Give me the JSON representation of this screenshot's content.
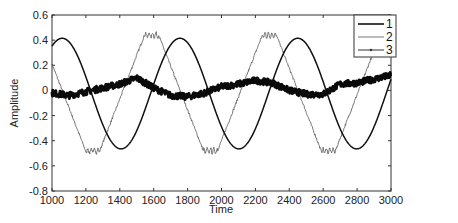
{
  "chart_data": {
    "type": "line",
    "title": "",
    "xlabel": "Time",
    "ylabel": "Amplitude",
    "xlim": [
      1000,
      3000
    ],
    "ylim": [
      -0.8,
      0.6
    ],
    "x_ticks": [
      "1000",
      "1200",
      "1400",
      "1600",
      "1800",
      "2000",
      "2200",
      "2400",
      "2600",
      "2800",
      "3000"
    ],
    "y_ticks": [
      "0.6",
      "0.4",
      "0.2",
      "0",
      "-0.2",
      "-0.4",
      "-0.6",
      "-0.8"
    ],
    "grid": false,
    "legend_position": "upper right",
    "x": [
      1000,
      1100,
      1200,
      1300,
      1400,
      1500,
      1600,
      1700,
      1800,
      1900,
      2000,
      2100,
      2200,
      2300,
      2400,
      2500,
      2600,
      2700,
      2800,
      2900,
      3000
    ],
    "series": [
      {
        "name": "1",
        "style": "thick dark smooth line",
        "values": [
          0.36,
          0.41,
          0.25,
          -0.05,
          -0.36,
          -0.47,
          -0.3,
          0.04,
          0.38,
          0.35,
          0.06,
          -0.33,
          -0.46,
          -0.28,
          0.3,
          0.43,
          0.24,
          -0.12,
          -0.45,
          -0.4,
          0.0
        ]
      },
      {
        "name": "2",
        "style": "thin gray line with zigzag plateaus",
        "values": [
          0.2,
          -0.15,
          -0.49,
          -0.49,
          -0.15,
          0.15,
          0.44,
          0.32,
          0.0,
          -0.4,
          -0.48,
          -0.18,
          0.18,
          0.45,
          0.28,
          -0.05,
          -0.38,
          -0.48,
          -0.1,
          0.22,
          0.4
        ]
      },
      {
        "name": "3",
        "style": "thick noisy line with markers",
        "values": [
          -0.02,
          -0.04,
          -0.01,
          0.02,
          0.05,
          0.1,
          0.02,
          -0.04,
          -0.05,
          -0.02,
          0.03,
          0.05,
          0.08,
          0.06,
          0.0,
          -0.03,
          -0.03,
          0.05,
          0.06,
          0.09,
          0.12
        ]
      }
    ]
  },
  "legend": {
    "items": [
      {
        "label": "1"
      },
      {
        "label": "2"
      },
      {
        "label": "3"
      }
    ]
  },
  "axes": {
    "xlabel": "Time",
    "ylabel": "Amplitude"
  },
  "colors": {
    "series1": "#111111",
    "series2": "#555555",
    "series3": "#0a0a0a",
    "frame": "#333333"
  }
}
